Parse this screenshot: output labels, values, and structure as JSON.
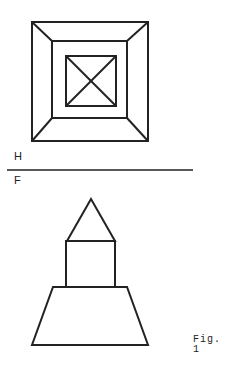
{
  "labels": {
    "top_view_label": "H",
    "front_view_label": "F",
    "figure_caption": "Fig. 1"
  },
  "colors": {
    "stroke": "#222222",
    "background": "#ffffff"
  },
  "top_view": {
    "outer_square": [
      32,
      22,
      148,
      141
    ],
    "middle_square": [
      52,
      41,
      127,
      118
    ],
    "inner_square": [
      66,
      56,
      116,
      106
    ]
  },
  "front_view": {
    "triangle_apex": [
      91,
      199
    ],
    "rectangle": [
      66,
      241,
      115,
      287
    ],
    "trapezoid_top": [
      53,
      127,
      287
    ],
    "trapezoid_bottom": [
      32,
      148,
      345
    ]
  }
}
